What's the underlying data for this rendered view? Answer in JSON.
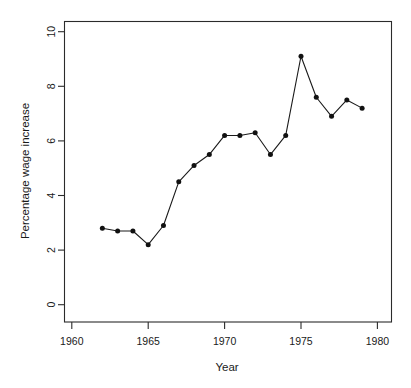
{
  "chart_data": {
    "type": "line",
    "title": "",
    "xlabel": "Year",
    "ylabel": "Percentage wage increase",
    "xlim": [
      1959,
      1981
    ],
    "ylim": [
      0,
      10.6
    ],
    "grid": false,
    "legend": null,
    "x": [
      1962,
      1963,
      1964,
      1965,
      1966,
      1967,
      1968,
      1969,
      1970,
      1971,
      1972,
      1973,
      1974,
      1975,
      1976,
      1977,
      1978,
      1979
    ],
    "values": [
      2.8,
      2.7,
      2.7,
      2.2,
      2.9,
      4.5,
      5.1,
      5.5,
      6.2,
      6.2,
      6.3,
      5.5,
      6.2,
      9.1,
      7.6,
      6.9,
      7.5,
      7.2
    ],
    "series": [
      {
        "name": "Percentage wage increase",
        "marker": "filled-circle",
        "color": "#111111",
        "values": [
          2.8,
          2.7,
          2.7,
          2.2,
          2.9,
          4.5,
          5.1,
          5.5,
          6.2,
          6.2,
          6.3,
          5.5,
          6.2,
          9.1,
          7.6,
          6.9,
          7.5,
          7.2
        ]
      }
    ],
    "xticks": [
      1960,
      1965,
      1970,
      1975,
      1980
    ],
    "xtick_labels": [
      "1960",
      "1965",
      "1970",
      "1975",
      "1980"
    ],
    "yticks": [
      0,
      2,
      4,
      6,
      8,
      10
    ],
    "ytick_labels": [
      "0",
      "2",
      "4",
      "6",
      "8",
      "10"
    ]
  },
  "axes": {
    "x_title": "Year",
    "y_title": "Percentage wage increase"
  },
  "ticks": {
    "x": [
      "1960",
      "1965",
      "1970",
      "1975",
      "1980"
    ],
    "y": [
      "0",
      "2",
      "4",
      "6",
      "8",
      "10"
    ]
  }
}
